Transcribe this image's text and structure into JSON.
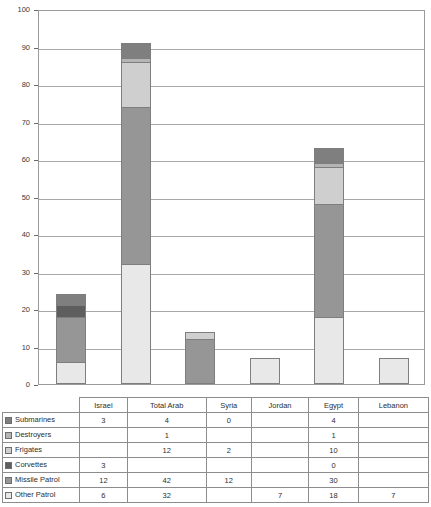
{
  "chart_data": {
    "type": "bar",
    "stacked": true,
    "title": "",
    "subtitle": "",
    "xlabel": "",
    "ylabel": "",
    "ylim": [
      0,
      100
    ],
    "ytick_values": [
      0,
      10,
      20,
      30,
      40,
      50,
      60,
      70,
      80,
      90,
      100
    ],
    "ytick_labels": [
      "0",
      "10",
      "20",
      "30",
      "40",
      "50",
      "60",
      "70",
      "80",
      "90",
      "100"
    ],
    "grid": true,
    "legend_position": "table-below",
    "categories": [
      "Israel",
      "Total Arab",
      "Syria",
      "Jordan",
      "Egypt",
      "Lebanon"
    ],
    "series": [
      {
        "name": "Submarines",
        "color": "#7f7f7f",
        "values": [
          3,
          4,
          0,
          null,
          4,
          null
        ],
        "labels": [
          "3",
          "4",
          "0",
          "",
          "4",
          ""
        ]
      },
      {
        "name": "Destroyers",
        "color": "#b5b5b5",
        "values": [
          null,
          1,
          null,
          null,
          1,
          null
        ],
        "labels": [
          "",
          "1",
          "",
          "",
          "1",
          ""
        ]
      },
      {
        "name": "Frigates",
        "color": "#cfcfcf",
        "values": [
          null,
          12,
          2,
          null,
          10,
          null
        ],
        "labels": [
          "",
          "12",
          "2",
          "",
          "10",
          ""
        ]
      },
      {
        "name": "Corvettes",
        "color": "#5e5e5e",
        "values": [
          3,
          null,
          null,
          null,
          0,
          null
        ],
        "labels": [
          "3",
          "",
          "",
          "",
          "0",
          ""
        ]
      },
      {
        "name": "Missile Patrol",
        "color": "#969696",
        "values": [
          12,
          42,
          12,
          null,
          30,
          null
        ],
        "labels": [
          "12",
          "42",
          "12",
          "",
          "30",
          ""
        ]
      },
      {
        "name": "Other Patrol",
        "color": "#e8e8e8",
        "values": [
          6,
          32,
          null,
          7,
          18,
          7
        ],
        "labels": [
          "6",
          "32",
          "",
          "7",
          "18",
          "7"
        ]
      }
    ],
    "totals": [
      24,
      91,
      14,
      7,
      63,
      7
    ]
  }
}
